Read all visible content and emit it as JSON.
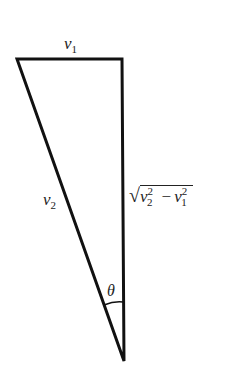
{
  "diagram": {
    "type": "right-triangle-vector",
    "vertices": {
      "top_left": [
        17,
        59
      ],
      "top_right": [
        122,
        59
      ],
      "bottom": [
        124,
        361
      ]
    },
    "labels": {
      "top_side": {
        "base": "v",
        "sub": "1"
      },
      "hypotenuse": {
        "base": "v",
        "sub": "2"
      },
      "vertical_side": {
        "radical": "√",
        "term1": {
          "base": "v",
          "sub": "2",
          "sup": "2"
        },
        "operator": "−",
        "term2": {
          "base": "v",
          "sub": "1",
          "sup": "2"
        }
      },
      "angle": "θ"
    },
    "colors": {
      "stroke": "#111111",
      "text": "#222222",
      "background": "#ffffff"
    }
  }
}
